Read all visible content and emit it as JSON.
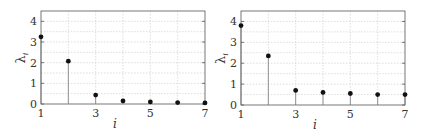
{
  "chart_data": [
    {
      "type": "stem",
      "title": "",
      "xlabel": "i",
      "ylabel": "λ_i",
      "xlim": [
        1,
        7
      ],
      "ylim": [
        0,
        4.5
      ],
      "xticks": [
        "1",
        "3",
        "5",
        "7"
      ],
      "yticks": [
        "0",
        "1",
        "2",
        "3",
        "4"
      ],
      "grid": true,
      "x": [
        1,
        2,
        3,
        4,
        5,
        6,
        7
      ],
      "values": [
        3.25,
        2.07,
        0.43,
        0.15,
        0.1,
        0.07,
        0.05
      ]
    },
    {
      "type": "stem",
      "title": "",
      "xlabel": "i",
      "ylabel": "λ_i",
      "xlim": [
        1,
        7
      ],
      "ylim": [
        0,
        4.5
      ],
      "xticks": [
        "1",
        "3",
        "5",
        "7"
      ],
      "yticks": [
        "0",
        "1",
        "2",
        "3",
        "4"
      ],
      "grid": true,
      "x": [
        1,
        2,
        3,
        4,
        5,
        6,
        7
      ],
      "values": [
        3.8,
        2.35,
        0.7,
        0.6,
        0.55,
        0.5,
        0.5
      ]
    }
  ],
  "panels": [
    {
      "xlabel": "i",
      "ylabel_main": "λ",
      "ylabel_sub": "i",
      "xticks": [
        "1",
        "3",
        "5",
        "7"
      ],
      "yticks": [
        "0",
        "1",
        "2",
        "3",
        "4"
      ]
    },
    {
      "xlabel": "i",
      "ylabel_main": "λ",
      "ylabel_sub": "i",
      "xticks": [
        "1",
        "3",
        "5",
        "7"
      ],
      "yticks": [
        "0",
        "1",
        "2",
        "3",
        "4"
      ]
    }
  ]
}
